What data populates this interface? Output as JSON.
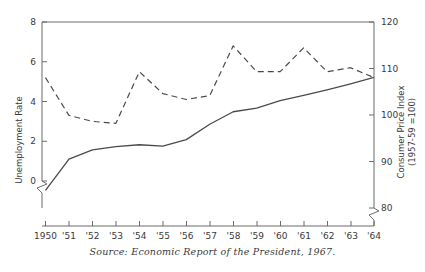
{
  "chart_data": {
    "type": "line",
    "title": "",
    "xlabel": "",
    "source_note": "Source: Economic Report of the President, 1967.",
    "grid": false,
    "legend": "none",
    "x": [
      1950,
      1951,
      1952,
      1953,
      1954,
      1955,
      1956,
      1957,
      1958,
      1959,
      1960,
      1961,
      1962,
      1963,
      1964
    ],
    "xtick_labels": [
      "1950",
      "'51",
      "'52",
      "'53",
      "'54",
      "'55",
      "'56",
      "'57",
      "'58",
      "'59",
      "'60",
      "'61",
      "'62",
      "'63",
      "'64"
    ],
    "axes": [
      {
        "side": "left",
        "label": "Unemployment Rate",
        "ticks": [
          0,
          2,
          4,
          6,
          8
        ],
        "tick_labels": [
          "0",
          "2",
          "4",
          "6",
          "8"
        ],
        "lim": [
          0,
          8
        ],
        "broken": true
      },
      {
        "side": "right",
        "label": "Consumer Price Index (1957-59 =100)",
        "label_line1": "Consumer Price Index",
        "label_line2": "(1957-59 =100)",
        "ticks": [
          80,
          90,
          100,
          110,
          120
        ],
        "tick_labels": [
          "80",
          "90",
          "100",
          "110",
          "120"
        ],
        "lim": [
          80,
          120
        ],
        "broken": true
      }
    ],
    "series": [
      {
        "name": "Unemployment Rate",
        "axis": "left",
        "style": "dashed",
        "color": "#4a4a4a",
        "values": [
          5.2,
          3.3,
          3.0,
          2.9,
          5.5,
          4.4,
          4.1,
          4.3,
          6.8,
          5.5,
          5.5,
          6.7,
          5.5,
          5.7,
          5.2
        ]
      },
      {
        "name": "Consumer Price Index",
        "axis": "right",
        "style": "solid",
        "color": "#4a4a4a",
        "values": [
          83.8,
          90.5,
          92.5,
          93.2,
          93.6,
          93.3,
          94.7,
          98.0,
          100.7,
          101.5,
          103.1,
          104.2,
          105.4,
          106.7,
          108.1
        ]
      }
    ]
  },
  "colors": {
    "axis": "#6b6b6b",
    "ink": "#3a3a3a",
    "line": "#4a4a4a",
    "background": "#ffffff"
  }
}
